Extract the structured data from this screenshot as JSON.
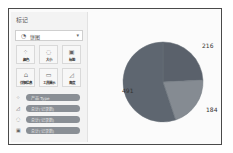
{
  "marks_card": {
    "title": "标记",
    "mark_type": {
      "icon": "pie-icon",
      "label": "饼图",
      "glyph": "◔",
      "chevron": "▾"
    },
    "buttons": [
      {
        "name": "color",
        "label": "颜色",
        "glyph": "⁘"
      },
      {
        "name": "size",
        "label": "大小",
        "glyph": "◌"
      },
      {
        "name": "label",
        "label": "标签",
        "glyph": "▣"
      },
      {
        "name": "detail",
        "label": "详细信息",
        "glyph": "⩍"
      },
      {
        "name": "tooltip",
        "label": "工具提示",
        "glyph": "▭"
      },
      {
        "name": "angle",
        "label": "角度",
        "glyph": "◿"
      }
    ],
    "pills": [
      {
        "icon": "color-icon",
        "glyph": "⁘",
        "label": "产品 Type"
      },
      {
        "icon": "angle-icon",
        "glyph": "◿",
        "label": "总计(记录数)"
      },
      {
        "icon": "size-icon",
        "glyph": "◌",
        "label": "总计(记录数)"
      },
      {
        "icon": "label-icon",
        "glyph": "▣",
        "label": "总计(记录数)"
      }
    ]
  },
  "colors": {
    "slice_large": "#5e6670",
    "slice_upper": "#5a616b",
    "slice_lower": "#858b92"
  },
  "chart_data": {
    "type": "pie",
    "title": "",
    "categories": [
      "A",
      "B",
      "C"
    ],
    "values": [
      216,
      184,
      491
    ],
    "labels": [
      "216",
      "184",
      "491"
    ],
    "start_angle_deg": 0,
    "direction": "clockwise",
    "legend": "none"
  }
}
